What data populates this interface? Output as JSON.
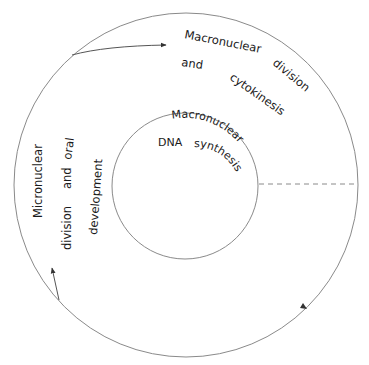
{
  "diagram": {
    "type": "cell-cycle",
    "colors": {
      "stroke": "#8a8a8a",
      "text": "#1a1a1a",
      "arrow": "#333333"
    },
    "inner": {
      "title_line1": "Macronuclear",
      "title_dna": "DNA",
      "title_line2": "synthesis"
    },
    "outer_top_right": {
      "line1_word1": "Macronuclear",
      "line1_word2": "division",
      "line2_word1": "and",
      "line2_word2": "cytokinesis"
    },
    "outer_left": {
      "line1": "Micronuclear",
      "line2_word1": "division",
      "line2_word2": "and",
      "line2_word3": "oral",
      "line3": "development"
    }
  }
}
